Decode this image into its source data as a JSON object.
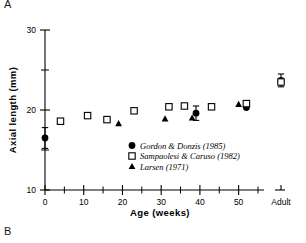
{
  "figure": {
    "panel_label_a": "A",
    "panel_label_b": "B"
  },
  "chart_data": {
    "type": "scatter",
    "title": "",
    "xlabel": "Age (weeks)",
    "ylabel": "Axial length (mm)",
    "xlim": [
      0,
      55
    ],
    "ylim": [
      10,
      30
    ],
    "grid": false,
    "x_major_ticks": [
      0,
      10,
      20,
      30,
      40,
      50
    ],
    "x_major_tick_labels": [
      "0",
      "10",
      "20",
      "30",
      "40",
      "50"
    ],
    "x_minor_ticks": [
      5,
      15,
      25,
      35,
      45,
      55
    ],
    "x_break_after": 55,
    "x_extra_category": "Adult",
    "y_major_ticks": [
      10,
      20,
      30
    ],
    "y_major_tick_labels": [
      "10",
      "20",
      "30"
    ],
    "y_minor_ticks": [
      15,
      25
    ],
    "legend_position": "inside-lower-right",
    "series": [
      {
        "name": "Gordon & Donzis (1985)",
        "marker": "filled-circle",
        "color": "#000000",
        "points": [
          {
            "x": 0,
            "y": 16.5,
            "yerr": 1.3
          },
          {
            "x": 39,
            "y": 19.6,
            "yerr": 0.9
          },
          {
            "x": 52,
            "y": 20.3,
            "yerr": 0.0
          },
          {
            "x": "Adult",
            "y": 23.7,
            "yerr": 0.8
          }
        ]
      },
      {
        "name": "Sampaolesi & Caruso (1982)",
        "marker": "open-square",
        "color": "#000000",
        "points": [
          {
            "x": 4,
            "y": 18.6
          },
          {
            "x": 11,
            "y": 19.3
          },
          {
            "x": 16,
            "y": 18.8
          },
          {
            "x": 23,
            "y": 19.9
          },
          {
            "x": 32,
            "y": 20.4
          },
          {
            "x": 36,
            "y": 20.5
          },
          {
            "x": 43,
            "y": 20.4
          },
          {
            "x": 52,
            "y": 20.8
          },
          {
            "x": "Adult",
            "y": 23.5
          }
        ]
      },
      {
        "name": "Larsen (1971)",
        "marker": "filled-triangle",
        "color": "#000000",
        "points": [
          {
            "x": 19,
            "y": 18.3
          },
          {
            "x": 31,
            "y": 18.9
          },
          {
            "x": 38,
            "y": 19.0
          },
          {
            "x": 50,
            "y": 20.7
          }
        ]
      }
    ]
  }
}
